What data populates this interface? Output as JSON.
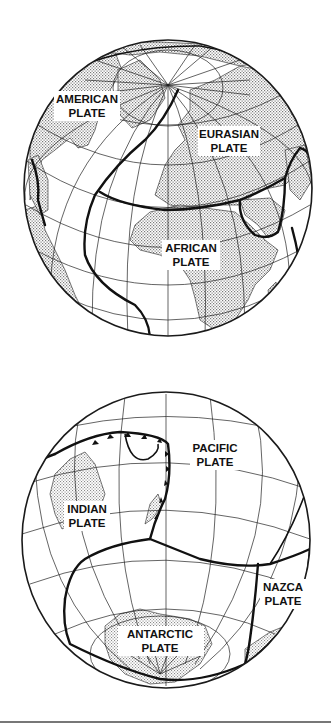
{
  "figure": {
    "type": "plate-tectonics-globe-diagram",
    "globes": [
      {
        "id": "north",
        "view": "Northern / Atlantic hemisphere",
        "plates": [
          {
            "name": "american",
            "label_line1": "AMERICAN",
            "label_line2": "PLATE"
          },
          {
            "name": "eurasian",
            "label_line1": "EURASIAN",
            "label_line2": "PLATE"
          },
          {
            "name": "african",
            "label_line1": "AFRICAN",
            "label_line2": "PLATE"
          }
        ]
      },
      {
        "id": "south",
        "view": "Southern / Pacific hemisphere",
        "plates": [
          {
            "name": "pacific",
            "label_line1": "PACIFIC",
            "label_line2": "PLATE"
          },
          {
            "name": "indian",
            "label_line1": "INDIAN",
            "label_line2": "PLATE"
          },
          {
            "name": "nazca",
            "label_line1": "NAZCA",
            "label_line2": "PLATE"
          },
          {
            "name": "antarctic",
            "label_line1": "ANTARCTIC",
            "label_line2": "PLATE"
          }
        ]
      }
    ]
  },
  "colors": {
    "line": "#111111",
    "land_stipple": "#9a9a9a",
    "background": "#ffffff",
    "rule": "#777777"
  }
}
